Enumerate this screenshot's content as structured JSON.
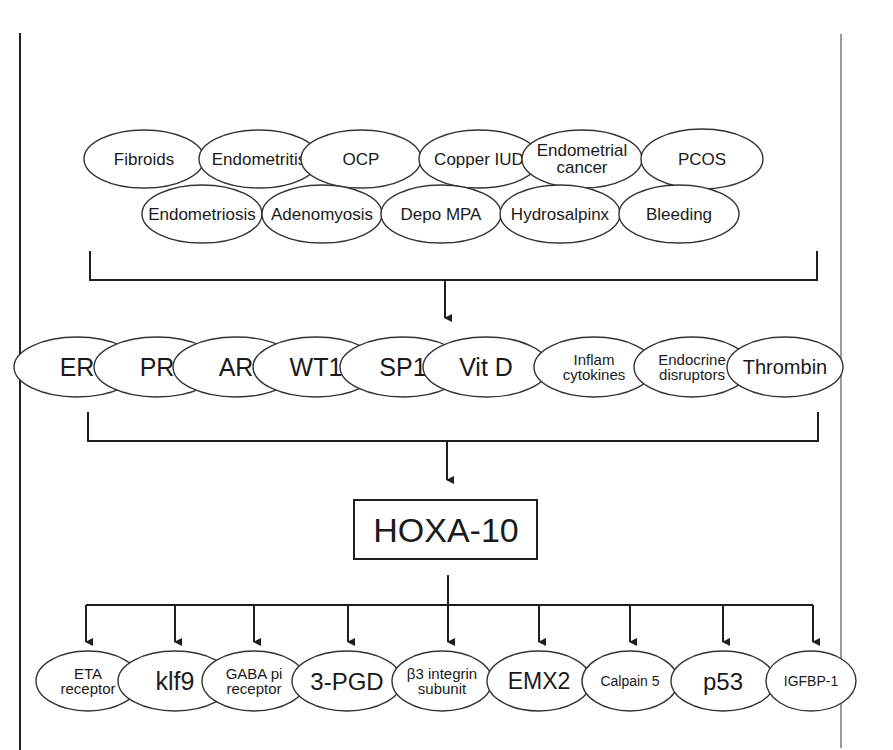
{
  "diagram": {
    "top_row_1": [
      {
        "lines": [
          "Fibroids"
        ],
        "cx": 144,
        "cy": 159,
        "rx": 60,
        "ry": 29,
        "size": 17
      },
      {
        "lines": [
          "Endometritis"
        ],
        "cx": 259,
        "cy": 159,
        "rx": 60,
        "ry": 29,
        "size": 17
      },
      {
        "lines": [
          "OCP"
        ],
        "cx": 361,
        "cy": 159,
        "rx": 60,
        "ry": 29,
        "size": 17
      },
      {
        "lines": [
          "Copper IUD"
        ],
        "cx": 479,
        "cy": 159,
        "rx": 60,
        "ry": 29,
        "size": 17
      },
      {
        "lines": [
          "Endometrial",
          "cancer"
        ],
        "cx": 582,
        "cy": 159,
        "rx": 60,
        "ry": 29,
        "size": 17
      },
      {
        "lines": [
          "PCOS"
        ],
        "cx": 702,
        "cy": 159,
        "rx": 61,
        "ry": 30,
        "size": 17
      }
    ],
    "top_row_2": [
      {
        "lines": [
          "Endometriosis"
        ],
        "cx": 202,
        "cy": 214,
        "rx": 60,
        "ry": 29,
        "size": 17
      },
      {
        "lines": [
          "Adenomyosis"
        ],
        "cx": 322,
        "cy": 214,
        "rx": 60,
        "ry": 29,
        "size": 17
      },
      {
        "lines": [
          "Depo MPA"
        ],
        "cx": 441,
        "cy": 214,
        "rx": 60,
        "ry": 29,
        "size": 17
      },
      {
        "lines": [
          "Hydrosalpinx"
        ],
        "cx": 560,
        "cy": 214,
        "rx": 60,
        "ry": 29,
        "size": 17
      },
      {
        "lines": [
          "Bleeding"
        ],
        "cx": 679,
        "cy": 214,
        "rx": 60,
        "ry": 29,
        "size": 17
      }
    ],
    "mediators": [
      {
        "lines": [
          "ER"
        ],
        "cx": 77,
        "cy": 367,
        "rx": 63,
        "ry": 30,
        "size": 25
      },
      {
        "lines": [
          "PR"
        ],
        "cx": 157,
        "cy": 367,
        "rx": 63,
        "ry": 30,
        "size": 25
      },
      {
        "lines": [
          "AR"
        ],
        "cx": 236,
        "cy": 367,
        "rx": 63,
        "ry": 30,
        "size": 25
      },
      {
        "lines": [
          "WT1"
        ],
        "cx": 316,
        "cy": 367,
        "rx": 63,
        "ry": 30,
        "size": 25
      },
      {
        "lines": [
          "SP1"
        ],
        "cx": 403,
        "cy": 367,
        "rx": 63,
        "ry": 30,
        "size": 25
      },
      {
        "lines": [
          "Vit D"
        ],
        "cx": 486,
        "cy": 367,
        "rx": 63,
        "ry": 30,
        "size": 25
      },
      {
        "lines": [
          "Inflam",
          "cytokines"
        ],
        "cx": 594,
        "cy": 367,
        "rx": 60,
        "ry": 30,
        "size": 15
      },
      {
        "lines": [
          "Endocrine",
          "disruptors"
        ],
        "cx": 692,
        "cy": 367,
        "rx": 58,
        "ry": 30,
        "size": 15
      },
      {
        "lines": [
          "Thrombin"
        ],
        "cx": 785,
        "cy": 367,
        "rx": 58,
        "ry": 30,
        "size": 20
      }
    ],
    "center_node": {
      "label": "HOXA-10",
      "size": 34
    },
    "targets": [
      {
        "lines": [
          "ETA",
          "receptor"
        ],
        "cx": 88,
        "cy": 681,
        "rx": 52,
        "ry": 30,
        "size": 15
      },
      {
        "lines": [
          "klf9"
        ],
        "cx": 175,
        "cy": 681,
        "rx": 57,
        "ry": 30,
        "size": 25
      },
      {
        "lines": [
          "GABA pi",
          "receptor"
        ],
        "cx": 254,
        "cy": 681,
        "rx": 52,
        "ry": 30,
        "size": 15
      },
      {
        "lines": [
          "3-PGD"
        ],
        "cx": 347,
        "cy": 681,
        "rx": 55,
        "ry": 30,
        "size": 24
      },
      {
        "lines": [
          "β3 integrin",
          "subunit"
        ],
        "cx": 442,
        "cy": 681,
        "rx": 50,
        "ry": 30,
        "size": 15
      },
      {
        "lines": [
          "EMX2"
        ],
        "cx": 539,
        "cy": 681,
        "rx": 52,
        "ry": 30,
        "size": 23
      },
      {
        "lines": [
          "Calpain 5"
        ],
        "cx": 630,
        "cy": 681,
        "rx": 48,
        "ry": 30,
        "size": 14
      },
      {
        "lines": [
          "p53"
        ],
        "cx": 723,
        "cy": 681,
        "rx": 52,
        "ry": 30,
        "size": 24
      },
      {
        "lines": [
          "IGFBP-1"
        ],
        "cx": 811,
        "cy": 681,
        "rx": 45,
        "ry": 30,
        "size": 14
      }
    ],
    "colors": {
      "stroke": "#1e1e1e",
      "text": "#1a1a1a",
      "background": "#ffffff"
    }
  }
}
